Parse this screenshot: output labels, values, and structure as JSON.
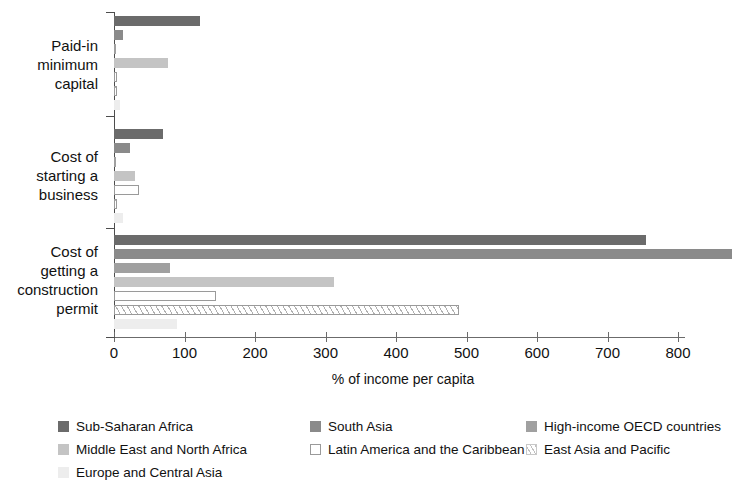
{
  "chart_data": {
    "type": "bar",
    "orientation": "horizontal",
    "title": "",
    "xlabel": "% of income per capita",
    "ylabel": "",
    "xlim": [
      0,
      870
    ],
    "xticks": [
      0,
      100,
      200,
      300,
      400,
      500,
      600,
      700,
      800
    ],
    "xtick_labels": [
      "0",
      "100",
      "200",
      "300",
      "400",
      "500",
      "600",
      "700",
      "800"
    ],
    "grid": false,
    "legend_position": "bottom",
    "categories": [
      "Paid-in\nminimum\ncapital",
      "Cost of\nstarting a\nbusiness",
      "Cost of\ngetting a\nconstruction\npermit"
    ],
    "series": [
      {
        "name": "Sub-Saharan Africa",
        "color": "#6b6b6b",
        "pattern": "solid",
        "values": [
          122,
          70,
          755
        ]
      },
      {
        "name": "South Asia",
        "color": "#8a8a8a",
        "pattern": "solid",
        "values": [
          13,
          23,
          877
        ]
      },
      {
        "name": "High-income OECD countries",
        "color": "#a0a0a0",
        "pattern": "solid",
        "values": [
          3,
          2,
          80
        ]
      },
      {
        "name": "Middle East and North Africa",
        "color": "#c4c4c4",
        "pattern": "solid",
        "values": [
          76,
          30,
          312
        ]
      },
      {
        "name": "Latin America and the Caribbean",
        "color": "#ffffff",
        "pattern": "outline",
        "values": [
          1,
          36,
          145
        ]
      },
      {
        "name": "East Asia and Pacific",
        "color": "#ffffff",
        "pattern": "hatch",
        "values": [
          1,
          3,
          490
        ]
      },
      {
        "name": "Europe and Central Asia",
        "color": "#ededed",
        "pattern": "solid",
        "values": [
          9,
          13,
          90
        ]
      }
    ]
  },
  "legend_layout": {
    "rows": [
      [
        0,
        1,
        2
      ],
      [
        3,
        4,
        5
      ],
      [
        6
      ]
    ],
    "columns_x": [
      0,
      252,
      468
    ]
  }
}
